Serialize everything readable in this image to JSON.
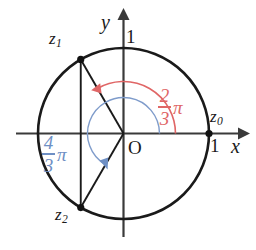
{
  "figure": {
    "background_color": "#ffffff",
    "stroke_color": "#1a1a1a"
  },
  "axes": {
    "x_label": "x",
    "y_label": "y",
    "origin_label": "O",
    "x_unit_label": "1",
    "y_unit_label": "1"
  },
  "points": [
    {
      "id": "z0",
      "label": "z",
      "subscript": "0",
      "angle_deg": 0,
      "x": 1.0,
      "y": 0.0
    },
    {
      "id": "z1",
      "label": "z",
      "subscript": "1",
      "angle_deg": 120,
      "x": -0.5,
      "y": 0.866
    },
    {
      "id": "z2",
      "label": "z",
      "subscript": "2",
      "angle_deg": 240,
      "x": -0.5,
      "y": -0.866
    }
  ],
  "angles": [
    {
      "id": "angle-red",
      "numerator": "2",
      "denominator": "3",
      "symbol": "π",
      "color": "#e06666",
      "sweep_deg": 120,
      "direction": "counterclockwise"
    },
    {
      "id": "angle-blue",
      "numerator": "4",
      "denominator": "3",
      "symbol": "π",
      "color": "#6e8fc4",
      "sweep_deg": 240,
      "direction": "counterclockwise"
    }
  ],
  "circle": {
    "radius_label": "1",
    "center_x": 123.5,
    "center_y": 133.5,
    "radius_px": 85.5
  }
}
